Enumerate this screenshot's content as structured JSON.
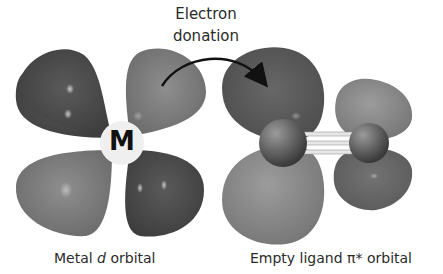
{
  "annotation": {
    "line1": "Electron",
    "line2": "donation"
  },
  "metal": {
    "center_label": "M",
    "caption_prefix": "Metal ",
    "caption_italic": "d",
    "caption_suffix": " orbital"
  },
  "ligand": {
    "caption": "Empty ligand π* orbital"
  },
  "colors": {
    "dark_lobe": "#4a4a4a",
    "light_lobe": "#7e7e7e",
    "atom": "#6a6a6a",
    "metal_circle": "#efefef",
    "arrow": "#111111",
    "text": "#2a2a2a"
  }
}
